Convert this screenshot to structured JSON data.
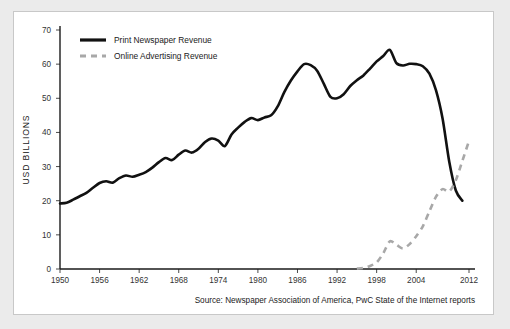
{
  "figure": {
    "background_color": "#ffffff",
    "page_background_color": "#ebebeb",
    "border_color": "#c8c8c8",
    "source_note": "Source: Newspaper Association of America, PwC State of the Internet reports"
  },
  "chart_data": {
    "type": "line",
    "title": "",
    "subtitle": "",
    "xlabel": "",
    "ylabel": "USD BILLIONS",
    "xlim": [
      1950,
      2012
    ],
    "ylim": [
      0,
      70
    ],
    "grid": false,
    "legend_position": "top-left",
    "x_ticks": [
      1950,
      1956,
      1962,
      1968,
      1974,
      1980,
      1986,
      1992,
      1998,
      2004,
      2012
    ],
    "x_tick_labels": [
      "1950",
      "1956",
      "1962",
      "1968",
      "1974",
      "1980",
      "1986",
      "1992",
      "1998",
      "2004",
      "2012"
    ],
    "y_ticks": [
      0,
      10,
      20,
      30,
      40,
      50,
      60,
      70
    ],
    "y_tick_labels": [
      "0",
      "10",
      "20",
      "30",
      "40",
      "50",
      "60",
      "70"
    ],
    "series": [
      {
        "name": "Print Newspaper Revenue",
        "color": "#111111",
        "style": "solid",
        "x": [
          1950,
          1951,
          1952,
          1953,
          1954,
          1955,
          1956,
          1957,
          1958,
          1959,
          1960,
          1961,
          1962,
          1963,
          1964,
          1965,
          1966,
          1967,
          1968,
          1969,
          1970,
          1971,
          1972,
          1973,
          1974,
          1975,
          1976,
          1977,
          1978,
          1979,
          1980,
          1981,
          1982,
          1983,
          1984,
          1985,
          1986,
          1987,
          1988,
          1989,
          1990,
          1991,
          1992,
          1993,
          1994,
          1995,
          1996,
          1997,
          1998,
          1999,
          2000,
          2001,
          2002,
          2003,
          2004,
          2005,
          2006,
          2007,
          2008,
          2009,
          2010,
          2011
        ],
        "y": [
          19.2,
          19.4,
          20.3,
          21.3,
          22.3,
          23.8,
          25.2,
          25.7,
          25.3,
          26.6,
          27.4,
          27.0,
          27.6,
          28.4,
          29.7,
          31.3,
          32.5,
          31.9,
          33.5,
          34.7,
          34.1,
          35.2,
          37.2,
          38.2,
          37.6,
          36.0,
          39.4,
          41.4,
          43.1,
          44.2,
          43.6,
          44.4,
          45.0,
          47.6,
          51.8,
          55.2,
          57.9,
          60.0,
          59.7,
          58.0,
          54.2,
          50.4,
          50.0,
          51.2,
          53.6,
          55.3,
          56.7,
          58.7,
          60.8,
          62.4,
          64.2,
          60.3,
          59.6,
          60.1,
          60.0,
          59.4,
          57.2,
          52.3,
          44.0,
          31.5,
          23.0,
          20.0
        ]
      },
      {
        "name": "Online Advertising Revenue",
        "color": "#a8a8a8",
        "style": "dashed",
        "x": [
          1995,
          1996,
          1997,
          1998,
          1999,
          2000,
          2001,
          2002,
          2003,
          2004,
          2005,
          2006,
          2007,
          2008,
          2009,
          2010,
          2011,
          2012
        ],
        "y": [
          0.1,
          0.3,
          0.9,
          1.9,
          4.6,
          8.1,
          7.1,
          6.0,
          7.3,
          9.6,
          12.5,
          16.9,
          21.2,
          23.4,
          22.7,
          26.0,
          31.7,
          37.5
        ]
      }
    ]
  },
  "legend": {
    "items": [
      {
        "label": "Print Newspaper Revenue",
        "color": "#111111",
        "style": "solid"
      },
      {
        "label": "Online Advertising Revenue",
        "color": "#a8a8a8",
        "style": "dashed"
      }
    ]
  }
}
